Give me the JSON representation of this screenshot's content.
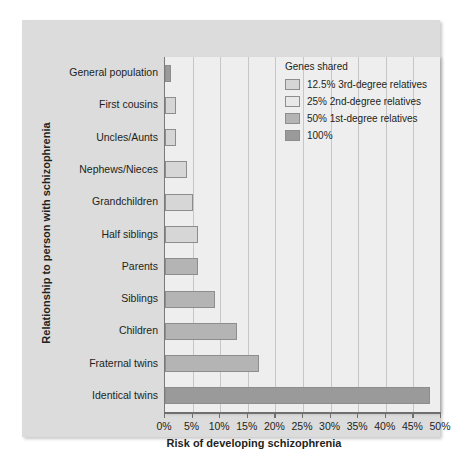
{
  "chart_data": {
    "type": "bar",
    "orientation": "horizontal",
    "title": "",
    "xlabel": "Risk of developing schizophrenia",
    "ylabel": "Relationship to person with schizophrenia",
    "xlim": [
      0,
      50
    ],
    "xtick_labels": [
      "0%",
      "5%",
      "10%",
      "15%",
      "20%",
      "25%",
      "30%",
      "35%",
      "40%",
      "45%",
      "50%"
    ],
    "xtick_values": [
      0,
      5,
      10,
      15,
      20,
      25,
      30,
      35,
      40,
      45,
      50
    ],
    "grid": true,
    "grid_axis": "x",
    "legend_position": "top-right",
    "categories": [
      "General population",
      "First cousins",
      "Uncles/Aunts",
      "Nephews/Nieces",
      "Grandchildren",
      "Half siblings",
      "Parents",
      "Siblings",
      "Children",
      "Fraternal twins",
      "Identical twins"
    ],
    "values": [
      1,
      2,
      2,
      4,
      5,
      6,
      6,
      9,
      13,
      17,
      48
    ],
    "bar_groups": [
      "full",
      "deg3",
      "deg3",
      "deg3",
      "deg3",
      "deg3",
      "deg1",
      "deg1",
      "deg1",
      "deg1",
      "full"
    ],
    "unit": "%"
  },
  "legend": {
    "title": "Genes shared",
    "items": [
      {
        "key": "deg3",
        "label": "12.5% 3rd-degree relatives",
        "color": "#d6d6d6"
      },
      {
        "key": "deg2",
        "label": "25% 2nd-degree relatives",
        "color": "#e8e8e8"
      },
      {
        "key": "deg1",
        "label": "50% 1st-degree relatives",
        "color": "#b4b4b4"
      },
      {
        "key": "full",
        "label": "100%",
        "color": "#9a9a9a"
      }
    ]
  },
  "axes": {
    "x_title": "Risk of developing schizophrenia",
    "y_title": "Relationship to person with schizophrenia"
  },
  "colors": {
    "panel_background": "#dcdcdc",
    "plot_background": "#eeeeee",
    "gridline": "#c6c6c6",
    "axis": "#6f6f6f",
    "text": "#231f20",
    "bar_border": "#8d8d8d"
  }
}
